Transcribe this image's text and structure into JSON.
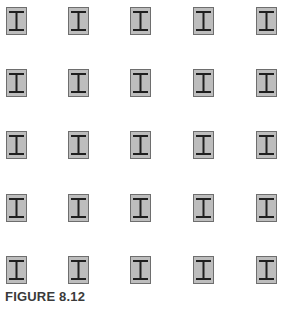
{
  "figure": {
    "caption": "FIGURE 8.12",
    "grid": {
      "rows": 5,
      "cols": 5
    },
    "col_x": [
      6,
      68,
      130,
      193,
      256
    ],
    "row_y": [
      7,
      69,
      131,
      194,
      256
    ],
    "cell_icon": "i-beam-icon",
    "colors": {
      "cell_fill": "#bdbdbd",
      "cell_border": "#6e6e6e",
      "beam": "#1f1f1f",
      "caption": "#3a3a3a"
    }
  }
}
